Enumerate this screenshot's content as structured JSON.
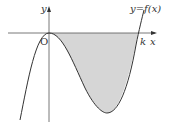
{
  "figure": {
    "type": "function-graph",
    "curve_label": "y=f(x)",
    "y_axis_label": "y",
    "x_axis_label": "x",
    "origin_label": "O",
    "root_label": "k",
    "shaded_region": "area between curve and x-axis from 0 to k",
    "colors": {
      "curve": "#333333",
      "axis": "#555555",
      "shade": "#d6d6d6",
      "background": "#ffffff"
    }
  }
}
